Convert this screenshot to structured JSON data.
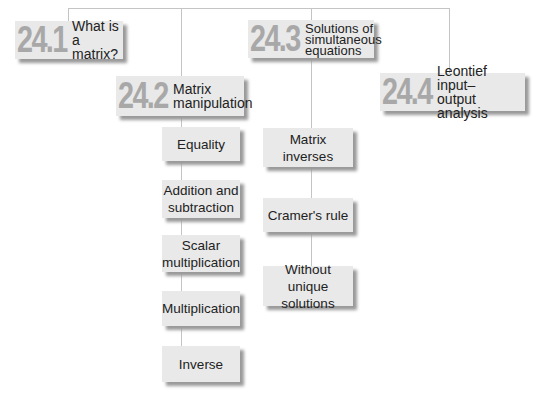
{
  "diagram": {
    "sections": [
      {
        "number": "24.1",
        "title": "What is a matrix?",
        "title_lines": [
          "What is a",
          "matrix?"
        ],
        "subtopics": []
      },
      {
        "number": "24.2",
        "title": "Matrix manipulation",
        "title_lines": [
          "Matrix",
          "manipulation"
        ],
        "subtopics": [
          "Equality",
          "Addition and subtraction",
          "Scalar multiplication",
          "Multiplication",
          "Inverse"
        ]
      },
      {
        "number": "24.3",
        "title": "Solutions of simultaneous equations",
        "title_lines": [
          "Solutions of",
          "simultaneous",
          "equations"
        ],
        "subtopics": [
          "Matrix inverses",
          "Cramer's rule",
          "Without unique solutions"
        ]
      },
      {
        "number": "24.4",
        "title": "Leontief input–output analysis",
        "title_lines": [
          "Leontief input–",
          "output analysis"
        ],
        "subtopics": []
      }
    ],
    "colors": {
      "box": "#e9e9e9",
      "number": "#a8a8a8",
      "line": "#c4c4c4",
      "shadow": "#9a9a9a",
      "text": "#222222"
    }
  }
}
